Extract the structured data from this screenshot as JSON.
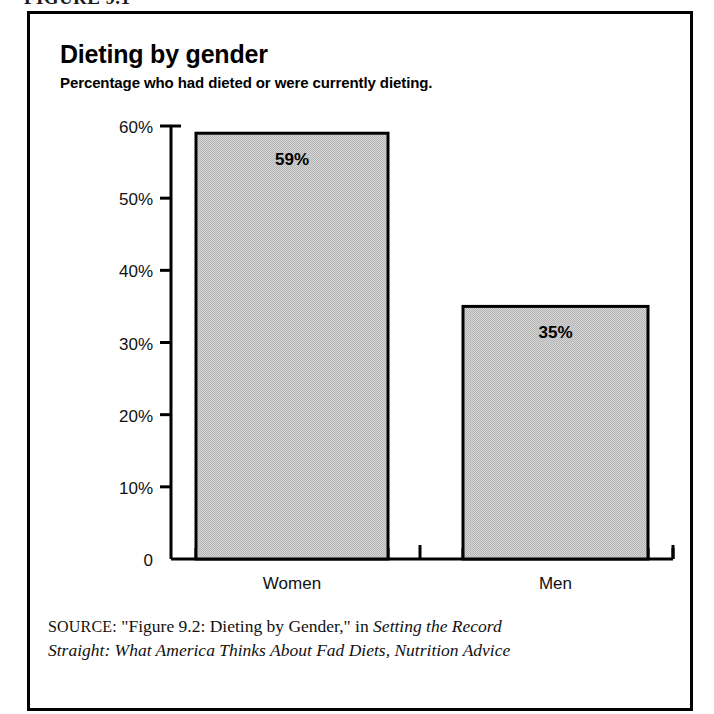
{
  "figure": {
    "number_label": "FIGURE 9.1"
  },
  "chart_data": {
    "type": "bar",
    "title": "Dieting by gender",
    "subtitle": "Percentage who had dieted or were currently dieting.",
    "categories": [
      "Women",
      "Men"
    ],
    "values": [
      59,
      35
    ],
    "value_labels": [
      "59%",
      "35%"
    ],
    "xlabel": "",
    "ylabel": "",
    "ylim": [
      0,
      60
    ],
    "ytick_values": [
      60,
      50,
      40,
      30,
      20,
      10,
      0
    ],
    "ytick_labels": [
      "60%",
      "50%",
      "40%",
      "30%",
      "20%",
      "10%",
      "0"
    ],
    "grid": false,
    "legend": false,
    "bar_fill_color": "#c9c9c9",
    "bar_edge_color": "#000000",
    "axis_color": "#000000",
    "background_color": "#ffffff"
  },
  "source": {
    "label": "SOURCE:",
    "line1_plain": " \"Figure 9.2: Dieting by Gender,\" in ",
    "line1_italic": "Setting the Record",
    "line2_italic": "Straight: What America Thinks About Fad Diets, Nutrition Advice"
  }
}
